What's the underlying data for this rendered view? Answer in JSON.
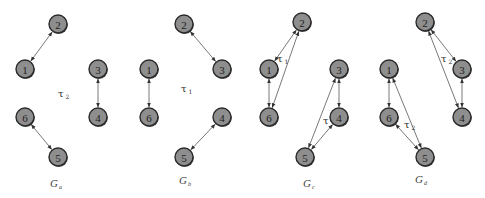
{
  "figure": {
    "graphs": [
      {
        "id": "a",
        "label": "G",
        "label_sub": "a",
        "label_pos": [
          50,
          187
        ],
        "tau": "τ",
        "tau_sub": "2",
        "tau_pos": [
          58,
          97
        ],
        "nodes": [
          {
            "id": "1",
            "x": 25,
            "y": 69
          },
          {
            "id": "2",
            "x": 58,
            "y": 24
          },
          {
            "id": "3",
            "x": 98,
            "y": 69
          },
          {
            "id": "4",
            "x": 98,
            "y": 117
          },
          {
            "id": "5",
            "x": 58,
            "y": 157
          },
          {
            "id": "6",
            "x": 25,
            "y": 117
          }
        ],
        "edges": [
          [
            "1",
            "2"
          ],
          [
            "3",
            "4"
          ],
          [
            "6",
            "5"
          ]
        ]
      },
      {
        "id": "b",
        "label": "G",
        "label_sub": "b",
        "label_pos": [
          179,
          184
        ],
        "tau": "τ",
        "tau_sub": "1",
        "tau_pos": [
          181,
          92
        ],
        "nodes": [
          {
            "id": "1",
            "x": 149,
            "y": 69
          },
          {
            "id": "2",
            "x": 184,
            "y": 24
          },
          {
            "id": "3",
            "x": 222,
            "y": 69
          },
          {
            "id": "4",
            "x": 222,
            "y": 117
          },
          {
            "id": "5",
            "x": 184,
            "y": 157
          },
          {
            "id": "6",
            "x": 149,
            "y": 117
          }
        ],
        "edges": [
          [
            "2",
            "3"
          ],
          [
            "1",
            "6"
          ],
          [
            "4",
            "5"
          ]
        ]
      },
      {
        "id": "c",
        "label": "G",
        "label_sub": "c",
        "label_pos": [
          303,
          187
        ],
        "tau": "τ",
        "tau_sub": "1",
        "tau_pos": [
          277,
          62
        ],
        "tau2": "τ",
        "tau2_sub": "",
        "tau2_pos": [
          323,
          124
        ],
        "nodes": [
          {
            "id": "1",
            "x": 269,
            "y": 69
          },
          {
            "id": "2",
            "x": 302,
            "y": 22
          },
          {
            "id": "3",
            "x": 339,
            "y": 69
          },
          {
            "id": "4",
            "x": 339,
            "y": 117
          },
          {
            "id": "5",
            "x": 305,
            "y": 157
          },
          {
            "id": "6",
            "x": 269,
            "y": 117
          }
        ],
        "edges": [
          [
            "1",
            "2"
          ],
          [
            "2",
            "6"
          ],
          [
            "1",
            "6"
          ],
          [
            "3",
            "4"
          ],
          [
            "3",
            "5"
          ],
          [
            "4",
            "5"
          ]
        ]
      },
      {
        "id": "d",
        "label": "G",
        "label_sub": "d",
        "label_pos": [
          415,
          183
        ],
        "tau": "τ",
        "tau_sub": "2",
        "tau_pos": [
          441,
          62
        ],
        "tau2": "τ",
        "tau2_sub": "2",
        "tau2_pos": [
          404,
          128
        ],
        "nodes": [
          {
            "id": "1",
            "x": 389,
            "y": 69
          },
          {
            "id": "2",
            "x": 425,
            "y": 22
          },
          {
            "id": "3",
            "x": 462,
            "y": 69
          },
          {
            "id": "4",
            "x": 462,
            "y": 117
          },
          {
            "id": "5",
            "x": 425,
            "y": 157
          },
          {
            "id": "6",
            "x": 389,
            "y": 117
          }
        ],
        "edges": [
          [
            "2",
            "3"
          ],
          [
            "2",
            "4"
          ],
          [
            "3",
            "4"
          ],
          [
            "1",
            "6"
          ],
          [
            "1",
            "5"
          ],
          [
            "6",
            "5"
          ]
        ]
      }
    ],
    "node_radius": 9,
    "colors": {
      "node_fill": "#8e8e8e",
      "node_stroke": "#2a2a2a",
      "edge": "#555555",
      "text": "#222222"
    }
  }
}
